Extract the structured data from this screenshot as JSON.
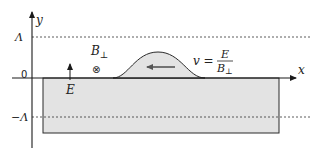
{
  "diagram": {
    "axes": {
      "x_label": "x",
      "y_label": "y",
      "origin_label": "0",
      "upper_bound_label": "Λ",
      "lower_bound_label": "−Λ"
    },
    "fields": {
      "electric_field_label": "E",
      "magnetic_field_label": "B",
      "magnetic_field_subscript": "⊥",
      "magnetic_field_symbol": "⊗"
    },
    "velocity": {
      "lhs": "v =",
      "numerator": "E",
      "denominator": "B",
      "denominator_subscript": "⊥",
      "direction": "left"
    },
    "colors": {
      "fill": "#e3e3e3",
      "stroke": "#2a2a2a",
      "dashed": "#333333",
      "background": "#ffffff"
    }
  }
}
